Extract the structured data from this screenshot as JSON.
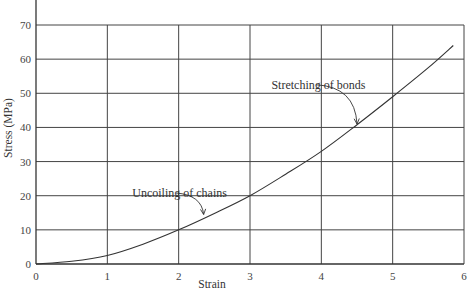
{
  "chart_data": {
    "type": "line",
    "title": "",
    "xlabel": "Strain",
    "ylabel": "Stress (MPa)",
    "xlim": [
      0,
      6
    ],
    "ylim": [
      0,
      70
    ],
    "grid": true,
    "legend": null,
    "x_ticks": [
      0,
      1,
      2,
      3,
      4,
      5,
      6
    ],
    "y_ticks": [
      0,
      10,
      20,
      30,
      40,
      50,
      60,
      70
    ],
    "series": [
      {
        "name": "Stress-strain curve",
        "x": [
          0,
          0.5,
          1,
          1.5,
          2,
          2.5,
          3,
          3.5,
          4,
          4.5,
          5,
          5.5,
          5.85
        ],
        "y": [
          0,
          0.8,
          2.5,
          5.8,
          10,
          14.8,
          20,
          26.3,
          33,
          40.8,
          49,
          57.5,
          64
        ]
      }
    ],
    "annotations": [
      {
        "text": "Uncoiling of chains",
        "label_pos": [
          1.35,
          20.8
        ],
        "arrow_to": [
          2.35,
          14.5
        ]
      },
      {
        "text": "Stretching of bonds",
        "label_pos": [
          3.3,
          52.5
        ],
        "arrow_to": [
          4.5,
          41
        ]
      }
    ]
  },
  "axes": {
    "x_title": "Strain",
    "y_title": "Stress (MPa)",
    "x_tick_labels": [
      "0",
      "1",
      "2",
      "3",
      "4",
      "5",
      "6"
    ],
    "y_tick_labels": [
      "0",
      "10",
      "20",
      "30",
      "40",
      "50",
      "60",
      "70"
    ]
  },
  "annotations": {
    "uncoiling": "Uncoiling of chains",
    "stretching": "Stretching of bonds"
  },
  "colors": {
    "grid": "#444444",
    "curve": "#333333",
    "text": "#444444",
    "background": "#ffffff"
  }
}
